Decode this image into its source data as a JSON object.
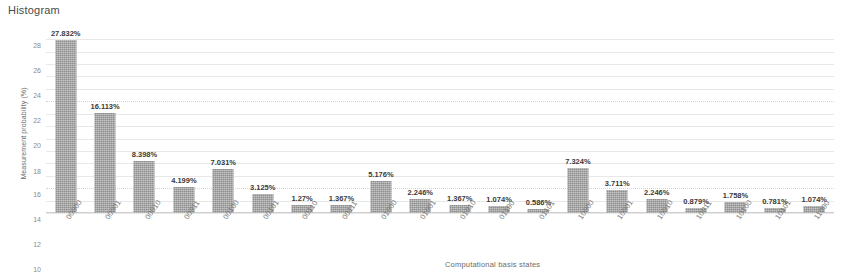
{
  "chart_title": "Histogram",
  "axes": {
    "ylabel": "Measurement probability (%)",
    "xlabel": "Computational basis states",
    "yticks": [
      "0",
      "2",
      "4",
      "6",
      "8",
      "10",
      "12",
      "14",
      "16",
      "18",
      "20",
      "22",
      "24",
      "26",
      "28"
    ]
  },
  "colors": {
    "bar": "#8e8e8e",
    "grid": "#e8e8e8",
    "text": "#3a3a3a"
  },
  "chart_data": {
    "type": "bar",
    "title": "Histogram",
    "xlabel": "Computational basis states",
    "ylabel": "Measurement probability (%)",
    "ylim": [
      0,
      29
    ],
    "grid": true,
    "legend": "none",
    "categories": [
      "00000",
      "00001",
      "00010",
      "00011",
      "00100",
      "00101",
      "00110",
      "00111",
      "01000",
      "01001",
      "01010",
      "01100",
      "01101",
      "10000",
      "10001",
      "10010",
      "10011",
      "10100",
      "10101",
      "11000"
    ],
    "values": [
      27.832,
      16.113,
      8.398,
      4.199,
      7.031,
      3.125,
      1.27,
      1.367,
      5.176,
      2.246,
      1.367,
      1.074,
      0.586,
      7.324,
      3.711,
      2.246,
      0.879,
      1.758,
      0.781,
      1.074
    ],
    "labels": [
      "27.832%",
      "16.113%",
      "8.398%",
      "4.199%",
      "7.031%",
      "3.125%",
      "1.27%",
      "1.367%",
      "5.176%",
      "2.246%",
      "1.367%",
      "1.074%",
      "0.586%",
      "7.324%",
      "3.711%",
      "2.246%",
      "0.879%",
      "1.758%",
      "0.781%",
      "1.074%"
    ]
  }
}
